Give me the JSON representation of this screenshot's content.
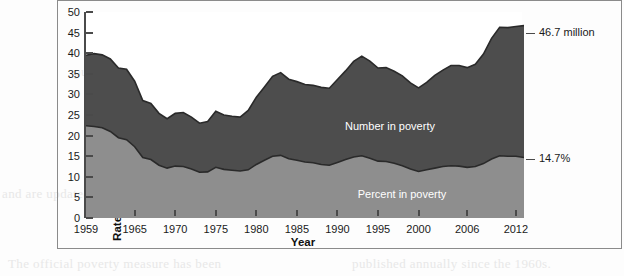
{
  "figure": {
    "y_axis_title": "Rates in Percent, Numbers in Millions",
    "x_axis_title": "Year"
  },
  "annotations": {
    "number_callout": "46.7 million",
    "percent_callout": "14.7%",
    "number_series_label": "Number in poverty",
    "percent_series_label": "Percent in poverty"
  },
  "ghost_text": [
    "The concept of poverty in the United",
    "States reflects the income needed to",
    "purchase a minimum basket of goods.",
    "Poverty thresholds vary by family size",
    "and are updated each year for inflation.",
    "The official poverty measure has been",
    "published annually since the 1960s."
  ],
  "colors": {
    "number_area": "#4d4d4d",
    "percent_area": "#8e8e8e",
    "axis": "#4a4a4a",
    "frame": "#8b8b8b",
    "text": "#1a1a1a",
    "series_label_text": "#ffffff"
  },
  "chart_data": {
    "type": "area",
    "title": "",
    "xlabel": "Year",
    "ylabel": "Rates in Percent, Numbers in Millions",
    "xlim": [
      1959,
      2013
    ],
    "ylim": [
      0,
      50
    ],
    "yticks": [
      0,
      5,
      10,
      15,
      20,
      25,
      30,
      35,
      40,
      45,
      50
    ],
    "xticks": [
      1959,
      1965,
      1970,
      1975,
      1980,
      1985,
      1990,
      1995,
      2000,
      2006,
      2012
    ],
    "xticklabels": [
      "1959",
      "1965",
      "1970",
      "1975",
      "1980",
      "1985",
      "1990",
      "1995",
      "2000",
      "2006",
      "2012"
    ],
    "grid": false,
    "legend": "in-plot labels",
    "x": [
      1959,
      1960,
      1961,
      1962,
      1963,
      1964,
      1965,
      1966,
      1967,
      1968,
      1969,
      1970,
      1971,
      1972,
      1973,
      1974,
      1975,
      1976,
      1977,
      1978,
      1979,
      1980,
      1981,
      1982,
      1983,
      1984,
      1985,
      1986,
      1987,
      1988,
      1989,
      1990,
      1991,
      1992,
      1993,
      1994,
      1995,
      1996,
      1997,
      1998,
      1999,
      2000,
      2001,
      2002,
      2003,
      2004,
      2005,
      2006,
      2007,
      2008,
      2009,
      2010,
      2011,
      2012,
      2013
    ],
    "series": [
      {
        "name": "Number in poverty",
        "units": "millions",
        "fill_color": "#4d4d4d",
        "label_in_plot": "Number in poverty",
        "end_annotation": "46.7 million",
        "values": [
          39.5,
          39.9,
          39.6,
          38.6,
          36.4,
          36.1,
          33.2,
          28.5,
          27.8,
          25.4,
          24.1,
          25.4,
          25.6,
          24.5,
          23.0,
          23.4,
          25.9,
          25.0,
          24.7,
          24.5,
          26.1,
          29.3,
          31.8,
          34.4,
          35.3,
          33.7,
          33.1,
          32.4,
          32.2,
          31.7,
          31.5,
          33.6,
          35.7,
          38.0,
          39.3,
          38.1,
          36.4,
          36.5,
          35.6,
          34.5,
          32.8,
          31.6,
          32.9,
          34.6,
          35.9,
          37.0,
          37.0,
          36.5,
          37.3,
          39.8,
          43.6,
          46.3,
          46.2,
          46.5,
          46.7
        ]
      },
      {
        "name": "Percent in poverty",
        "units": "percent",
        "fill_color": "#8e8e8e",
        "label_in_plot": "Percent in poverty",
        "end_annotation": "14.7%",
        "values": [
          22.4,
          22.2,
          21.9,
          21.0,
          19.5,
          19.0,
          17.3,
          14.7,
          14.2,
          12.8,
          12.1,
          12.6,
          12.5,
          11.9,
          11.1,
          11.2,
          12.3,
          11.8,
          11.6,
          11.4,
          11.7,
          13.0,
          14.0,
          15.0,
          15.2,
          14.4,
          14.0,
          13.6,
          13.4,
          13.0,
          12.8,
          13.5,
          14.2,
          14.8,
          15.1,
          14.5,
          13.8,
          13.7,
          13.3,
          12.7,
          11.9,
          11.3,
          11.7,
          12.1,
          12.5,
          12.7,
          12.6,
          12.3,
          12.5,
          13.2,
          14.3,
          15.1,
          15.0,
          15.0,
          14.7
        ]
      }
    ]
  }
}
